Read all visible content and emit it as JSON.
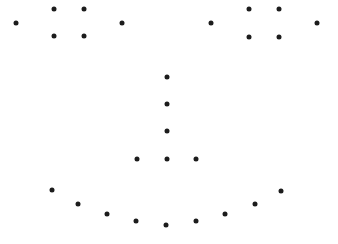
{
  "figure": {
    "width": 338,
    "height": 244,
    "dot_color": "#1c1c1c",
    "background": "#ffffff",
    "dot_diameter": 5
  },
  "groups": [
    {
      "name": "left-eye",
      "points": [
        [
          16,
          23
        ],
        [
          54,
          9
        ],
        [
          84,
          9
        ],
        [
          122,
          23
        ],
        [
          54,
          36
        ],
        [
          84,
          36
        ]
      ]
    },
    {
      "name": "right-eye",
      "points": [
        [
          211,
          23
        ],
        [
          249,
          9
        ],
        [
          279,
          9
        ],
        [
          317,
          23
        ],
        [
          249,
          37
        ],
        [
          279,
          37
        ]
      ]
    },
    {
      "name": "nose",
      "points": [
        [
          167,
          77
        ],
        [
          167,
          104
        ],
        [
          167,
          131
        ],
        [
          137,
          159
        ],
        [
          167,
          159
        ],
        [
          196,
          159
        ]
      ]
    },
    {
      "name": "mouth",
      "points": [
        [
          52,
          190
        ],
        [
          78,
          204
        ],
        [
          107,
          214
        ],
        [
          136,
          221
        ],
        [
          166,
          225
        ],
        [
          196,
          221
        ],
        [
          225,
          214
        ],
        [
          255,
          204
        ],
        [
          281,
          191
        ]
      ]
    }
  ]
}
